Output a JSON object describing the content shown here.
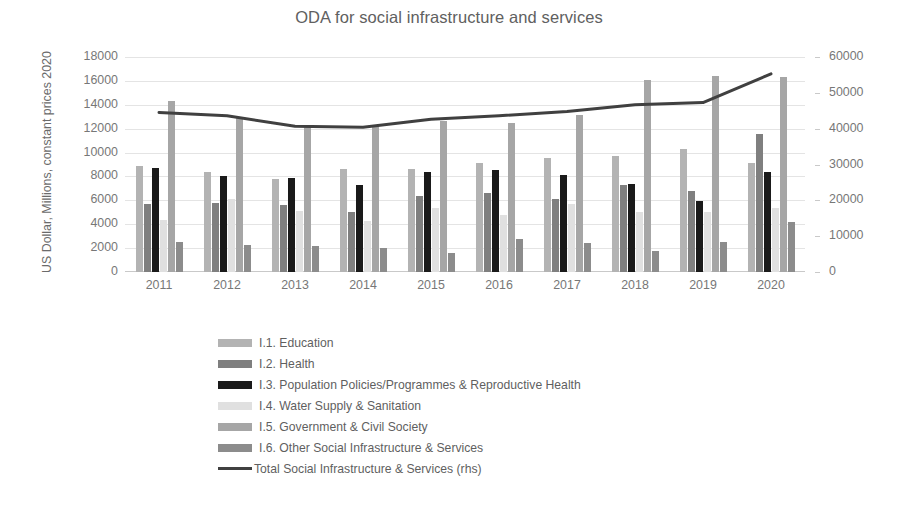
{
  "chart_data": {
    "type": "bar",
    "title": "ODA for social infrastructure and services",
    "xlabel": "",
    "ylabel": "US Dollar, Millions, constant prices 2020",
    "ylabel_right": "",
    "categories": [
      "2011",
      "2012",
      "2013",
      "2014",
      "2015",
      "2016",
      "2017",
      "2018",
      "2019",
      "2020"
    ],
    "ylim": [
      0,
      18000
    ],
    "ylim_right": [
      0,
      60000
    ],
    "yticks": [
      0,
      2000,
      4000,
      6000,
      8000,
      10000,
      12000,
      14000,
      16000,
      18000
    ],
    "yticks_right": [
      0,
      10000,
      20000,
      30000,
      40000,
      50000,
      60000
    ],
    "grid": true,
    "legend_position": "bottom",
    "series": [
      {
        "name": "I.1. Education",
        "axis": "left",
        "kind": "bar",
        "color": "#b3b3b3",
        "values": [
          8850,
          8400,
          7750,
          8600,
          8600,
          9150,
          9550,
          9750,
          10300,
          9150
        ]
      },
      {
        "name": "I.2. Health",
        "axis": "left",
        "kind": "bar",
        "color": "#7f7f7f",
        "values": [
          5700,
          5800,
          5600,
          5050,
          6400,
          6650,
          6150,
          7250,
          6750,
          11550
        ]
      },
      {
        "name": "I.3. Population Policies/Programmes & Reproductive Health",
        "axis": "left",
        "kind": "bar",
        "color": "#1a1a1a",
        "values": [
          8750,
          8050,
          7900,
          7300,
          8350,
          8550,
          8150,
          7350,
          5950,
          8350
        ]
      },
      {
        "name": "I.4. Water Supply & Sanitation",
        "axis": "left",
        "kind": "bar",
        "color": "#e0e0e0",
        "values": [
          4350,
          6100,
          5150,
          4250,
          5400,
          4800,
          5700,
          5000,
          5050,
          5350
        ]
      },
      {
        "name": "I.5. Government & Civil Society",
        "axis": "left",
        "kind": "bar",
        "color": "#a6a6a6",
        "values": [
          14300,
          13000,
          12250,
          12250,
          12650,
          12500,
          13150,
          16050,
          16400,
          16350
        ]
      },
      {
        "name": "I.6. Other Social Infrastructure & Services",
        "axis": "left",
        "kind": "bar",
        "color": "#8c8c8c",
        "values": [
          2500,
          2300,
          2150,
          2000,
          1600,
          2800,
          2400,
          1750,
          2500,
          4200
        ]
      },
      {
        "name": "Total Social Infrastructure & Services (rhs)",
        "axis": "right",
        "kind": "line",
        "color": "#404040",
        "values": [
          44500,
          43600,
          40700,
          40400,
          42600,
          43600,
          44800,
          46700,
          47300,
          55300
        ]
      }
    ],
    "legend": [
      {
        "label": "I.1. Education",
        "color": "#b3b3b3",
        "type": "bar"
      },
      {
        "label": "I.2. Health",
        "color": "#7f7f7f",
        "type": "bar"
      },
      {
        "label": "I.3. Population Policies/Programmes & Reproductive Health",
        "color": "#1a1a1a",
        "type": "bar"
      },
      {
        "label": "I.4. Water Supply & Sanitation",
        "color": "#e0e0e0",
        "type": "bar"
      },
      {
        "label": "I.5. Government & Civil Society",
        "color": "#a6a6a6",
        "type": "bar"
      },
      {
        "label": "I.6. Other Social Infrastructure & Services",
        "color": "#8c8c8c",
        "type": "bar"
      },
      {
        "label": "Total Social Infrastructure & Services (rhs)",
        "color": "#404040",
        "type": "line"
      }
    ]
  }
}
